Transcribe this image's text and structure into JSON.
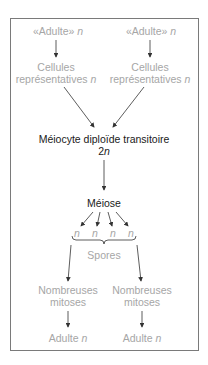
{
  "diagram": {
    "top_left": {
      "adult": "«Adulte»",
      "ploidy": "n",
      "cells_line1": "Cellules",
      "cells_line2": "représentatives",
      "cells_ploidy": "n"
    },
    "top_right": {
      "adult": "«Adulte»",
      "ploidy": "n",
      "cells_line1": "Cellules",
      "cells_line2": "représentatives",
      "cells_ploidy": "n"
    },
    "meiocyte": {
      "label": "Méiocyte diploïde transitoire",
      "ploidy_num": "2",
      "ploidy_var": "n"
    },
    "meiosis": {
      "label": "Méiose"
    },
    "products": [
      "n",
      "n",
      "n",
      "n"
    ],
    "spores": {
      "label": "Spores"
    },
    "bottom_left": {
      "mitoses_line1": "Nombreuses",
      "mitoses_line2": "mitoses",
      "adult": "Adulte",
      "ploidy": "n"
    },
    "bottom_right": {
      "mitoses_line1": "Nombreuses",
      "mitoses_line2": "mitoses",
      "adult": "Adulte",
      "ploidy": "n"
    },
    "colors": {
      "grey_text": "#a6a6a6",
      "dark_text": "#1a1a1a",
      "arrow": "#333333",
      "frame": "#7a7a7a"
    }
  }
}
